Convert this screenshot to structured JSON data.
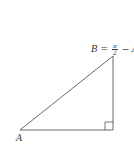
{
  "diagram": {
    "type": "right-triangle",
    "stroke_color": "#444444",
    "vertices": {
      "A": {
        "x": 20,
        "y": 130
      },
      "right_angle": {
        "x": 113,
        "y": 130
      },
      "B": {
        "x": 113,
        "y": 56
      }
    },
    "labels": {
      "A": "A",
      "B_prefix": "B =",
      "B_frac_num": "π",
      "B_frac_den": "2",
      "B_suffix": "− A"
    },
    "right_angle_marker_size": 8
  }
}
